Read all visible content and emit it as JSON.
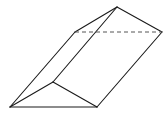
{
  "diagram": {
    "type": "triangular-prism",
    "stroke_color": "#1a1a1a",
    "hidden_edge_color": "#555555",
    "vertices": {
      "A": [
        10,
        107
      ],
      "B": [
        97,
        107
      ],
      "C": [
        53,
        82
      ],
      "D": [
        75,
        32
      ],
      "E": [
        162,
        32
      ],
      "F": [
        117,
        7
      ]
    },
    "solid_edges": [
      [
        "A",
        "B"
      ],
      [
        "A",
        "C"
      ],
      [
        "C",
        "B"
      ],
      [
        "A",
        "D"
      ],
      [
        "B",
        "E"
      ],
      [
        "C",
        "F"
      ],
      [
        "D",
        "F"
      ],
      [
        "F",
        "E"
      ]
    ],
    "dashed_edges": [
      [
        "D",
        "E"
      ]
    ]
  }
}
